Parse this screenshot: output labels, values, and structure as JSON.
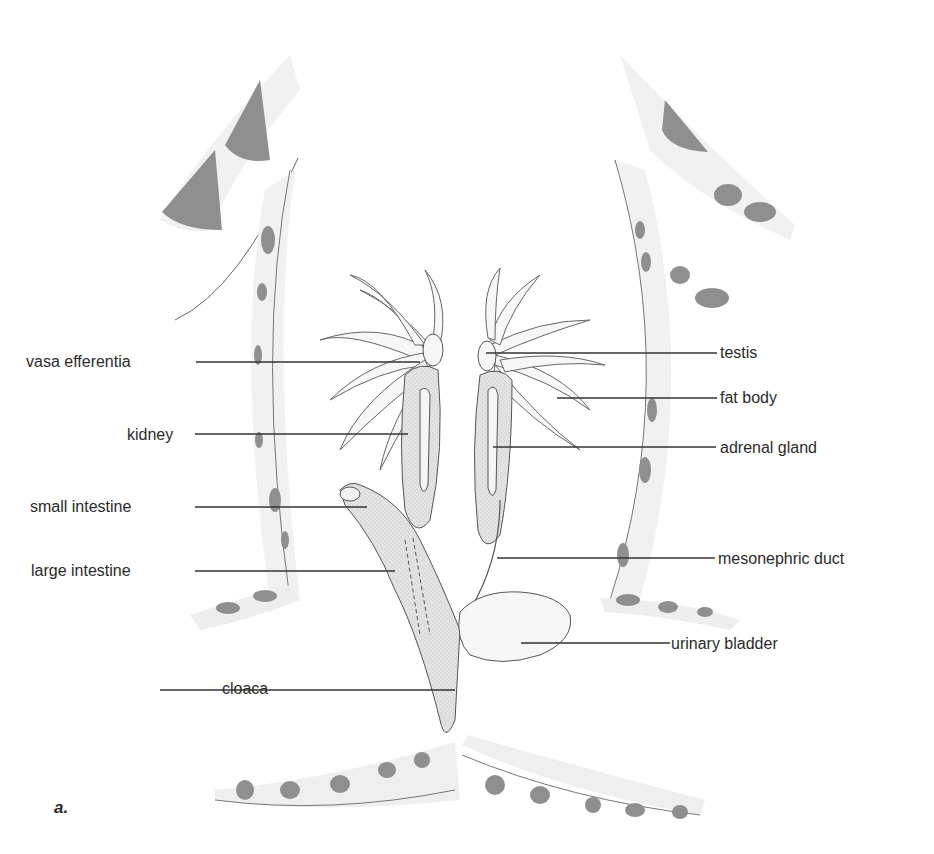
{
  "figure": {
    "panel_label": "a.",
    "colors": {
      "stroke": "#555555",
      "organ_fill": "#d9d9d9",
      "spot_fill": "#8c8c8c",
      "skin_fill": "#efefef",
      "leader": "#333333"
    }
  },
  "labels": {
    "left": [
      {
        "text": "vasa efferentia",
        "x": 26,
        "y": 353,
        "line_to": 420
      },
      {
        "text": "kidney",
        "x": 127,
        "y": 426,
        "line_to": 408
      },
      {
        "text": "small intestine",
        "x": 30,
        "y": 498,
        "line_to": 367
      },
      {
        "text": "large intestine",
        "x": 31,
        "y": 562,
        "line_to": 395
      },
      {
        "text": "cloaca",
        "x": 222,
        "y": 680,
        "line_to": 455
      }
    ],
    "right": [
      {
        "text": "testis",
        "x": 720,
        "y": 344,
        "line_from": 486
      },
      {
        "text": "fat body",
        "x": 720,
        "y": 389,
        "line_from": 557
      },
      {
        "text": "adrenal gland",
        "x": 720,
        "y": 439,
        "line_from": 493
      },
      {
        "text": "mesonephric duct",
        "x": 718,
        "y": 550,
        "line_from": 497
      },
      {
        "text": "urinary bladder",
        "x": 671,
        "y": 635,
        "line_from": 521
      }
    ]
  }
}
